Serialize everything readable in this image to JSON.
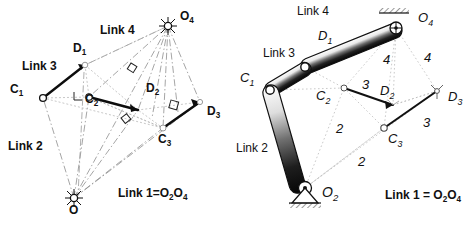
{
  "figure": {
    "panels": [
      {
        "id": "left",
        "name": "construction-panel",
        "style": "schematic line construction with dash-dot rays",
        "labels": [
          {
            "name": "label-link-4",
            "text": "Link 4",
            "x": 100,
            "y": 30,
            "style": "bold",
            "size": 12
          },
          {
            "name": "label-d1",
            "text": "D",
            "sub": "1",
            "x": 73,
            "y": 48,
            "style": "bold",
            "size": 12
          },
          {
            "name": "label-link-3",
            "text": "Link 3",
            "x": 22,
            "y": 66,
            "style": "bold",
            "size": 12
          },
          {
            "name": "label-o4",
            "text": "O",
            "sub": "4",
            "x": 180,
            "y": 16,
            "style": "bold",
            "size": 12
          },
          {
            "name": "label-c1",
            "text": "C",
            "sub": "1",
            "x": 10,
            "y": 89,
            "style": "bold",
            "size": 12
          },
          {
            "name": "label-c2",
            "text": "C",
            "sub": "2",
            "x": 85,
            "y": 99,
            "style": "bold",
            "size": 12
          },
          {
            "name": "label-d2",
            "text": "D",
            "sub": "2",
            "x": 146,
            "y": 88,
            "style": "bold",
            "size": 12
          },
          {
            "name": "label-d3",
            "text": "D",
            "sub": "3",
            "x": 207,
            "y": 111,
            "style": "bold",
            "size": 12
          },
          {
            "name": "label-c3",
            "text": "C",
            "sub": "3",
            "x": 158,
            "y": 139,
            "style": "bold",
            "size": 12
          },
          {
            "name": "label-link-2",
            "text": "Link 2",
            "x": 8,
            "y": 146,
            "style": "bold",
            "size": 12
          },
          {
            "name": "label-o2",
            "text": "O",
            "x": 69,
            "y": 210,
            "style": "bold",
            "size": 12
          },
          {
            "name": "label-link-1",
            "text": "Link 1=O",
            "sub": "2",
            "text2": "O",
            "sub2": "4",
            "x": 118,
            "y": 193,
            "style": "bold",
            "size": 12
          }
        ],
        "points": {
          "C1": [
            43,
            98
          ],
          "C2": [
            89,
            97
          ],
          "C3": [
            163,
            128
          ],
          "D1": [
            85,
            65
          ],
          "D2": [
            138,
            110
          ],
          "D3": [
            200,
            102
          ],
          "O4": [
            168,
            26
          ],
          "O2": [
            74,
            198
          ]
        }
      },
      {
        "id": "right",
        "name": "mechanism-panel",
        "style": "shaded solid links with ground pivots and hatching",
        "labels": [
          {
            "name": "label-link-4",
            "text": "Link 4",
            "x": 297,
            "y": 10,
            "style": "plain",
            "size": 12
          },
          {
            "name": "label-d1",
            "text": "D",
            "sub": "1",
            "x": 318,
            "y": 36,
            "style": "italic",
            "size": 13
          },
          {
            "name": "label-link-3",
            "text": "Link 3",
            "x": 263,
            "y": 53,
            "style": "plain",
            "size": 12
          },
          {
            "name": "label-c1",
            "text": "C",
            "sub": "1",
            "x": 240,
            "y": 78,
            "style": "italic",
            "size": 13
          },
          {
            "name": "label-o4",
            "text": "O",
            "sub": "4",
            "x": 418,
            "y": 17,
            "style": "italic",
            "size": 13
          },
          {
            "name": "label-num-4a",
            "text": "4",
            "x": 383,
            "y": 59,
            "style": "italic",
            "size": 13
          },
          {
            "name": "label-num-4b",
            "text": "4",
            "x": 424,
            "y": 57,
            "style": "italic",
            "size": 13
          },
          {
            "name": "label-c2",
            "text": "C",
            "sub": "2",
            "x": 316,
            "y": 95,
            "style": "italic",
            "size": 13
          },
          {
            "name": "label-num-3a",
            "text": "3",
            "x": 362,
            "y": 84,
            "style": "italic",
            "size": 13
          },
          {
            "name": "label-d2",
            "text": "D",
            "sub": "2",
            "x": 380,
            "y": 90,
            "style": "italic",
            "size": 13
          },
          {
            "name": "label-d3",
            "text": "D",
            "sub": "3",
            "x": 448,
            "y": 96,
            "style": "italic",
            "size": 13
          },
          {
            "name": "label-num-3b",
            "text": "3",
            "x": 423,
            "y": 122,
            "style": "italic",
            "size": 13
          },
          {
            "name": "label-c3",
            "text": "C",
            "sub": "3",
            "x": 388,
            "y": 138,
            "style": "italic",
            "size": 13
          },
          {
            "name": "label-num-2a",
            "text": "2",
            "x": 336,
            "y": 128,
            "style": "italic",
            "size": 13
          },
          {
            "name": "label-num-2b",
            "text": "2",
            "x": 358,
            "y": 161,
            "style": "italic",
            "size": 13
          },
          {
            "name": "label-link-2",
            "text": "Link 2",
            "x": 236,
            "y": 148,
            "style": "plain",
            "size": 12
          },
          {
            "name": "label-o2",
            "text": "O",
            "sub": "2",
            "x": 322,
            "y": 192,
            "style": "italic",
            "size": 14
          },
          {
            "name": "label-link-1",
            "text": "Link 1 = O",
            "sub": "2",
            "text2": "O",
            "sub2": "4",
            "x": 385,
            "y": 195,
            "style": "bold",
            "size": 12
          }
        ],
        "points": {
          "C1": [
            270,
            90
          ],
          "C2": [
            344,
            88
          ],
          "C3": [
            384,
            128
          ],
          "D1": [
            305,
            67
          ],
          "D2": [
            393,
            105
          ],
          "D3": [
            437,
            91
          ],
          "O4": [
            396,
            28
          ],
          "O2": [
            305,
            188
          ]
        }
      }
    ],
    "colors": {
      "ink": "#111111",
      "light_ink": "#8a8a8a",
      "construction": "#9a9a9a",
      "paper": "#ffffff",
      "link_fill": "#f2f2f2",
      "link_shade": "#3a3a3a"
    }
  }
}
